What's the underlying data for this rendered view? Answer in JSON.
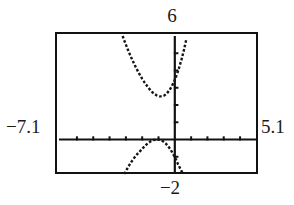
{
  "window": {
    "xmin_label": "−7.1",
    "xmax_label": "5.1",
    "ymin_label": "−2",
    "ymax_label": "6"
  },
  "chart_data": {
    "type": "line",
    "title": "",
    "xlabel": "",
    "ylabel": "",
    "xlim": [
      -7.1,
      5.1
    ],
    "ylim": [
      -2,
      6
    ],
    "grid": false,
    "legend": null,
    "axis_style": "graphing-calculator",
    "x_axis_position": 0,
    "y_axis_position": 0,
    "x_tick_spacing": 1,
    "y_tick_spacing": 1,
    "x_tick_values": [
      -7,
      -6,
      -5,
      -4,
      -3,
      -2,
      -1,
      0,
      1,
      2,
      3,
      4,
      5
    ],
    "y_tick_values": [
      -1,
      1,
      2,
      3,
      4,
      5
    ],
    "render_style": "dotted",
    "series": [
      {
        "name": "upper-branch",
        "description": "upward-opening parabola-like branch above the x-axis",
        "x": [
          -3.2,
          -3.05,
          -2.9,
          -2.75,
          -2.6,
          -2.45,
          -2.3,
          -2.15,
          -2.0,
          -1.85,
          -1.7,
          -1.55,
          -1.4,
          -1.25,
          -1.1,
          -0.95,
          -0.8,
          -0.65,
          -0.5,
          -0.35,
          -0.2,
          -0.05,
          0.1,
          0.25,
          0.4,
          0.55,
          0.7
        ],
        "y": [
          6.0,
          5.62,
          5.26,
          4.92,
          4.6,
          4.3,
          4.02,
          3.76,
          3.52,
          3.3,
          3.1,
          2.92,
          2.76,
          2.64,
          2.55,
          2.5,
          2.5,
          2.55,
          2.66,
          2.83,
          3.06,
          3.35,
          3.7,
          4.12,
          4.6,
          5.15,
          5.78
        ]
      },
      {
        "name": "lower-branch",
        "description": "downward-opening branch below the x-axis touching y=0 near x=-1.0",
        "x": [
          -3.1,
          -2.95,
          -2.8,
          -2.65,
          -2.5,
          -2.35,
          -2.2,
          -2.05,
          -1.9,
          -1.75,
          -1.6,
          -1.45,
          -1.3,
          -1.15,
          -1.0,
          -0.85,
          -0.7,
          -0.55,
          -0.4,
          -0.25,
          -0.1,
          0.05,
          0.2,
          0.35,
          0.5
        ],
        "y": [
          -2.0,
          -1.74,
          -1.5,
          -1.28,
          -1.08,
          -0.9,
          -0.74,
          -0.6,
          -0.44,
          -0.3,
          -0.18,
          -0.09,
          -0.03,
          -0.01,
          0.0,
          -0.04,
          -0.12,
          -0.24,
          -0.4,
          -0.6,
          -0.84,
          -1.12,
          -1.44,
          -1.72,
          -2.0
        ]
      }
    ]
  }
}
